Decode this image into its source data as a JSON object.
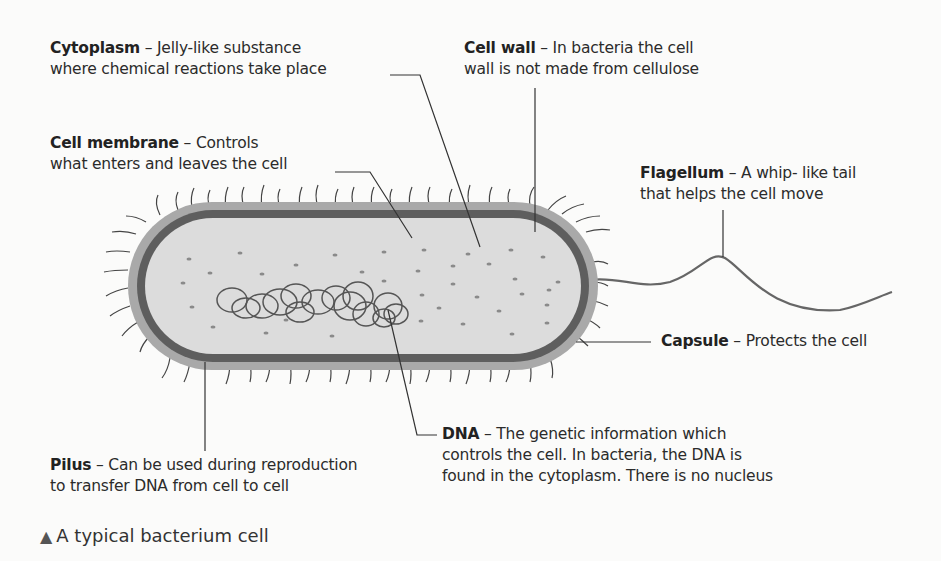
{
  "diagram": {
    "title": "A typical bacterium cell",
    "caption_marker": "▲",
    "labels": [
      {
        "id": "cytoplasm",
        "term": "Cytoplasm",
        "dash": " – ",
        "line1": " Jelly-like  substance",
        "line2": "where chemical reactions take place"
      },
      {
        "id": "cell-membrane",
        "term": "Cell membrane",
        "dash": " – ",
        "line1": "Controls",
        "line2": "what enters and leaves the cell"
      },
      {
        "id": "cell-wall",
        "term": "Cell wall",
        "dash": " – ",
        "line1": "In bacteria the cell",
        "line2": "wall is not made from cellulose"
      },
      {
        "id": "flagellum",
        "term": "Flagellum",
        "dash": " – ",
        "line1": "A whip- like tail",
        "line2": "that helps the cell move"
      },
      {
        "id": "capsule",
        "term": "Capsule",
        "dash": " – ",
        "line1": "Protects the cell"
      },
      {
        "id": "dna",
        "term": "DNA",
        "dash": " – ",
        "line1": "The genetic information which",
        "line2": "controls the cell. In bacteria, the DNA is",
        "line3": "found in the cytoplasm. There is no nucleus"
      },
      {
        "id": "pilus",
        "term": "Pilus",
        "dash": " – ",
        "line1": " Can be used during reproduction",
        "line2": "to transfer DNA from cell to cell"
      }
    ],
    "colors": {
      "capsule": "#a9a9a9",
      "wall": "#5e5e5e",
      "cytoplasm": "#dcdcdc",
      "dots": "#8a8a8a",
      "dna": "#555555",
      "leader": "#333333"
    }
  }
}
